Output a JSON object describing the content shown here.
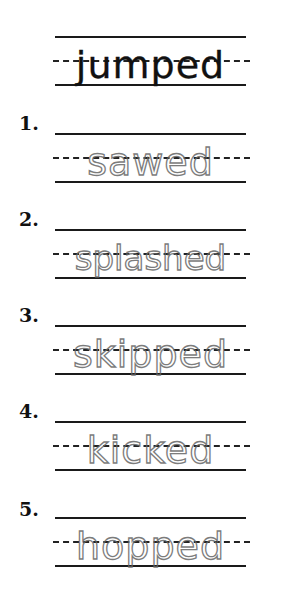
{
  "worksheet": {
    "model_word": "jumped",
    "items": [
      {
        "number": "1.",
        "trace_word": "sawed"
      },
      {
        "number": "2.",
        "trace_word": "splashed"
      },
      {
        "number": "3.",
        "trace_word": "skipped"
      },
      {
        "number": "4.",
        "trace_word": "kicked"
      },
      {
        "number": "5.",
        "trace_word": "hopped"
      }
    ]
  }
}
